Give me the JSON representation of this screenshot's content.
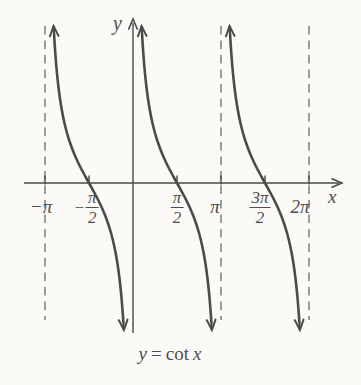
{
  "figure": {
    "caption": {
      "lhs": "y",
      "equals": "=",
      "func": "cot",
      "variable": "x"
    }
  },
  "chart_data": {
    "type": "line",
    "function": "y = cot(x)",
    "xlabel": "x",
    "ylabel": "y",
    "grid": false,
    "x_range_pi": [
      -1.2,
      2.3
    ],
    "x_ticks": [
      {
        "label": "−π",
        "value_pi": -1,
        "style": "plain",
        "label_dx": -4
      },
      {
        "label": "−π/2",
        "value_pi": -0.5,
        "style": "fraction",
        "sign": "−",
        "num": "π",
        "den": "2",
        "label_dx": -3
      },
      {
        "label": "π/2",
        "value_pi": 0.5,
        "style": "fraction",
        "sign": "",
        "num": "π",
        "den": "2",
        "label_dx": 0
      },
      {
        "label": "π",
        "value_pi": 1,
        "style": "plain",
        "label_dx": -6
      },
      {
        "label": "3π/2",
        "value_pi": 1.5,
        "style": "fraction",
        "sign": "",
        "num": "3π",
        "den": "2",
        "label_dx": -5
      },
      {
        "label": "2π",
        "value_pi": 2,
        "style": "plain",
        "label_dx": -9
      }
    ],
    "dashed_asymptotes_pi": [
      -1,
      1,
      2
    ],
    "solid_asymptote_pi": 0,
    "branches_pi": [
      [
        -1,
        0
      ],
      [
        0,
        1
      ],
      [
        1,
        2
      ]
    ],
    "zeros_pi": [
      -0.5,
      0.5,
      1.5
    ],
    "layout": {
      "origin_px": [
        133,
        183
      ],
      "px_per_half_pi": 44,
      "amplitude_px": 50,
      "curve_top_px": 34,
      "curve_bottom_px": 322,
      "asymptote_top_px": 26,
      "asymptote_bottom_px": 320,
      "x_axis_px": [
        24,
        339
      ],
      "y_axis_px": [
        23,
        333
      ],
      "plain_label_top_px": 196,
      "fraction_label_top_px": 189
    },
    "colors": {
      "curve": "#4b4b4b",
      "axis": "#484848",
      "dashed": "#7d7d7d",
      "text": "#4d4d4d",
      "background": "#fbfaf7"
    }
  }
}
